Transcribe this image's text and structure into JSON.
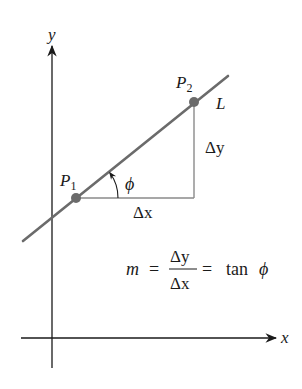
{
  "diagram": {
    "type": "slope-of-line",
    "axes": {
      "x_label": "x",
      "y_label": "y"
    },
    "line": {
      "label": "L",
      "color": "#6b6b6b"
    },
    "points": [
      {
        "id": "p1",
        "name": "P",
        "subscript": "1",
        "color": "#6b6b6b"
      },
      {
        "id": "p2",
        "name": "P",
        "subscript": "2",
        "color": "#6b6b6b"
      }
    ],
    "triangle": {
      "run_label": "Δx",
      "rise_label": "Δy",
      "color": "#8a8a8a"
    },
    "angle": {
      "label": "ϕ"
    },
    "formula": {
      "lhs": "m",
      "eq1": "=",
      "numerator": "Δy",
      "denominator": "Δx",
      "eq2": "=",
      "rhs_func": "tan",
      "rhs_var": "ϕ"
    },
    "colors": {
      "axis": "#1a1a1a",
      "line": "#6b6b6b",
      "triangle": "#8a8a8a",
      "text": "#1a1a1a"
    }
  }
}
